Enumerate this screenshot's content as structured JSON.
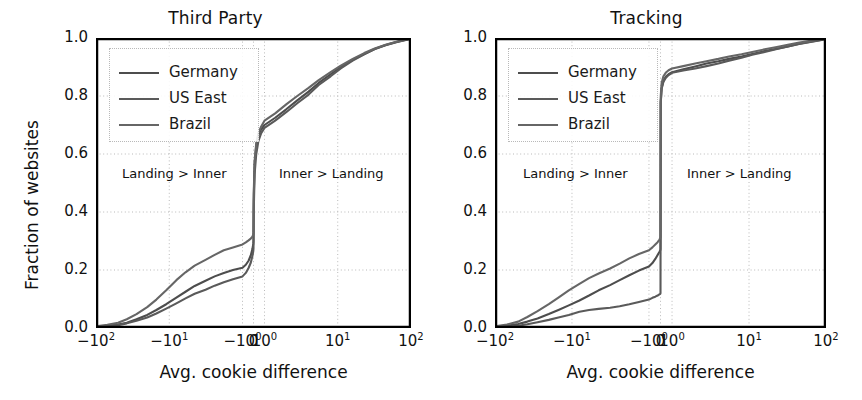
{
  "figure": {
    "width": 862,
    "height": 400,
    "background": "#ffffff",
    "line_color": "#4d4d4d",
    "axis_color": "#000000",
    "grid_color": "#b9b9b9"
  },
  "chart_data": [
    {
      "type": "line",
      "title": "Third Party",
      "xlabel": "Avg. cookie difference",
      "ylabel": "Fraction of websites",
      "grid": true,
      "legend_position": "upper left",
      "xscale": "symlog",
      "xlim": [
        -100,
        100
      ],
      "ylim": [
        0.0,
        1.0
      ],
      "xticks": [
        -100,
        -10,
        -1,
        0,
        1,
        10,
        100
      ],
      "xticklabels": [
        "−10²",
        "−10¹",
        "−10⁰",
        "0",
        "10⁰",
        "10¹",
        "10²"
      ],
      "yticks": [
        0.0,
        0.2,
        0.4,
        0.6,
        0.8,
        1.0
      ],
      "yticklabels": [
        "0.0",
        "0.2",
        "0.4",
        "0.6",
        "0.8",
        "1.0"
      ],
      "annotations": [
        {
          "text": "Landing > Inner",
          "x": -8,
          "y": 0.47
        },
        {
          "text": "Inner > Landing",
          "x": 7,
          "y": 0.47
        }
      ],
      "series": [
        {
          "name": "Germany",
          "x": [
            -100,
            -70,
            -50,
            -38,
            -28,
            -20,
            -15,
            -11,
            -8.0,
            -6.0,
            -4.5,
            -3.2,
            -2.4,
            -1.8,
            -1.35,
            -1.0,
            -0.7,
            -0.45,
            -0.25,
            -0.1,
            -0.02,
            0,
            0.02,
            0.1,
            0.25,
            0.45,
            0.7,
            1.0,
            1.4,
            2.0,
            2.8,
            4.0,
            5.5,
            8.0,
            11,
            16,
            23,
            32,
            45,
            63,
            85,
            100
          ],
          "y": [
            0.005,
            0.008,
            0.012,
            0.018,
            0.03,
            0.045,
            0.062,
            0.082,
            0.105,
            0.125,
            0.145,
            0.163,
            0.178,
            0.19,
            0.2,
            0.208,
            0.218,
            0.232,
            0.25,
            0.272,
            0.29,
            0.3,
            0.44,
            0.565,
            0.63,
            0.665,
            0.685,
            0.7,
            0.725,
            0.755,
            0.785,
            0.815,
            0.845,
            0.875,
            0.9,
            0.925,
            0.945,
            0.962,
            0.975,
            0.985,
            0.993,
            0.998
          ]
        },
        {
          "name": "US East",
          "x": [
            -100,
            -70,
            -50,
            -38,
            -28,
            -20,
            -15,
            -11,
            -8.0,
            -6.0,
            -4.5,
            -3.2,
            -2.4,
            -1.8,
            -1.35,
            -1.0,
            -0.7,
            -0.45,
            -0.25,
            -0.1,
            -0.02,
            0,
            0.02,
            0.1,
            0.25,
            0.45,
            0.7,
            1.0,
            1.4,
            2.0,
            2.8,
            4.0,
            5.5,
            8.0,
            11,
            16,
            23,
            32,
            45,
            63,
            85,
            100
          ],
          "y": [
            0.004,
            0.006,
            0.01,
            0.016,
            0.025,
            0.036,
            0.05,
            0.067,
            0.085,
            0.102,
            0.118,
            0.132,
            0.146,
            0.158,
            0.168,
            0.178,
            0.19,
            0.207,
            0.225,
            0.248,
            0.265,
            0.275,
            0.4,
            0.53,
            0.6,
            0.645,
            0.672,
            0.69,
            0.715,
            0.745,
            0.775,
            0.805,
            0.838,
            0.868,
            0.895,
            0.922,
            0.944,
            0.962,
            0.976,
            0.986,
            0.994,
            0.998
          ]
        },
        {
          "name": "Brazil",
          "x": [
            -100,
            -70,
            -50,
            -38,
            -28,
            -20,
            -15,
            -11,
            -8.0,
            -6.0,
            -4.5,
            -3.2,
            -2.4,
            -1.8,
            -1.35,
            -1.0,
            -0.7,
            -0.45,
            -0.25,
            -0.1,
            -0.02,
            0,
            0.02,
            0.1,
            0.25,
            0.45,
            0.7,
            1.0,
            1.4,
            2.0,
            2.8,
            4.0,
            5.5,
            8.0,
            11,
            16,
            23,
            32,
            45,
            63,
            85,
            100
          ],
          "y": [
            0.006,
            0.011,
            0.018,
            0.03,
            0.048,
            0.072,
            0.098,
            0.13,
            0.165,
            0.192,
            0.215,
            0.235,
            0.252,
            0.268,
            0.278,
            0.288,
            0.295,
            0.302,
            0.308,
            0.315,
            0.322,
            0.328,
            0.46,
            0.575,
            0.638,
            0.672,
            0.695,
            0.715,
            0.74,
            0.772,
            0.8,
            0.828,
            0.855,
            0.882,
            0.905,
            0.928,
            0.948,
            0.964,
            0.977,
            0.987,
            0.994,
            0.999
          ]
        }
      ]
    },
    {
      "type": "line",
      "title": "Tracking",
      "xlabel": "Avg. cookie difference",
      "ylabel": "Fraction of websites",
      "grid": true,
      "legend_position": "upper left",
      "xscale": "symlog",
      "xlim": [
        -100,
        100
      ],
      "ylim": [
        0.0,
        1.0
      ],
      "xticks": [
        -100,
        -10,
        -1,
        0,
        1,
        10,
        100
      ],
      "xticklabels": [
        "−10²",
        "−10¹",
        "−10⁰",
        "0",
        "10⁰",
        "10¹",
        "10²"
      ],
      "yticks": [
        0.0,
        0.2,
        0.4,
        0.6,
        0.8,
        1.0
      ],
      "yticklabels": [
        "0.0",
        "0.2",
        "0.4",
        "0.6",
        "0.8",
        "1.0"
      ],
      "annotations": [
        {
          "text": "Landing > Inner",
          "x": -8,
          "y": 0.47
        },
        {
          "text": "Inner > Landing",
          "x": 7,
          "y": 0.47
        }
      ],
      "series": [
        {
          "name": "Germany",
          "x": [
            -100,
            -70,
            -50,
            -38,
            -28,
            -20,
            -15,
            -11,
            -8.0,
            -6.0,
            -4.5,
            -3.2,
            -2.4,
            -1.8,
            -1.35,
            -1.0,
            -0.7,
            -0.45,
            -0.25,
            -0.1,
            -0.02,
            0,
            0.02,
            0.1,
            0.25,
            0.45,
            0.7,
            1.0,
            1.4,
            2.0,
            2.8,
            4.0,
            5.5,
            8.0,
            11,
            16,
            23,
            32,
            45,
            63,
            85,
            100
          ],
          "y": [
            0.004,
            0.008,
            0.014,
            0.022,
            0.033,
            0.048,
            0.062,
            0.078,
            0.095,
            0.112,
            0.13,
            0.148,
            0.165,
            0.182,
            0.198,
            0.212,
            0.224,
            0.238,
            0.252,
            0.262,
            0.268,
            0.272,
            0.78,
            0.828,
            0.852,
            0.866,
            0.875,
            0.882,
            0.892,
            0.902,
            0.912,
            0.92,
            0.928,
            0.936,
            0.945,
            0.955,
            0.963,
            0.971,
            0.98,
            0.987,
            0.993,
            0.998
          ]
        },
        {
          "name": "US East",
          "x": [
            -100,
            -70,
            -50,
            -38,
            -28,
            -20,
            -15,
            -11,
            -8.0,
            -6.0,
            -4.5,
            -3.2,
            -2.4,
            -1.8,
            -1.35,
            -1.0,
            -0.7,
            -0.45,
            -0.25,
            -0.1,
            -0.02,
            0,
            0.02,
            0.1,
            0.25,
            0.45,
            0.7,
            1.0,
            1.4,
            2.0,
            2.8,
            4.0,
            5.5,
            8.0,
            11,
            16,
            23,
            32,
            45,
            63,
            85,
            100
          ],
          "y": [
            0.003,
            0.005,
            0.008,
            0.013,
            0.02,
            0.028,
            0.036,
            0.045,
            0.056,
            0.062,
            0.066,
            0.07,
            0.075,
            0.082,
            0.09,
            0.098,
            0.104,
            0.108,
            0.112,
            0.116,
            0.118,
            0.12,
            0.775,
            0.825,
            0.848,
            0.862,
            0.872,
            0.88,
            0.888,
            0.895,
            0.903,
            0.912,
            0.922,
            0.932,
            0.942,
            0.952,
            0.962,
            0.971,
            0.979,
            0.986,
            0.992,
            0.997
          ]
        },
        {
          "name": "Brazil",
          "x": [
            -100,
            -70,
            -50,
            -38,
            -28,
            -20,
            -15,
            -11,
            -8.0,
            -6.0,
            -4.5,
            -3.2,
            -2.4,
            -1.8,
            -1.35,
            -1.0,
            -0.7,
            -0.45,
            -0.25,
            -0.1,
            -0.02,
            0,
            0.02,
            0.1,
            0.25,
            0.45,
            0.7,
            1.0,
            1.4,
            2.0,
            2.8,
            4.0,
            5.5,
            8.0,
            11,
            16,
            23,
            32,
            45,
            63,
            85,
            100
          ],
          "y": [
            0.006,
            0.012,
            0.022,
            0.038,
            0.058,
            0.082,
            0.105,
            0.13,
            0.152,
            0.172,
            0.188,
            0.205,
            0.222,
            0.24,
            0.255,
            0.268,
            0.278,
            0.288,
            0.296,
            0.304,
            0.31,
            0.315,
            0.8,
            0.845,
            0.868,
            0.88,
            0.889,
            0.895,
            0.903,
            0.912,
            0.92,
            0.928,
            0.936,
            0.944,
            0.952,
            0.961,
            0.969,
            0.977,
            0.984,
            0.99,
            0.995,
            0.999
          ]
        }
      ]
    }
  ],
  "legend": {
    "entries": [
      "Germany",
      "US East",
      "Brazil"
    ]
  }
}
